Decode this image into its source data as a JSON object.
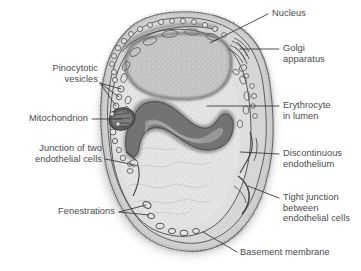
{
  "figure": {
    "style": "grayscale line drawing with stipple shading and drop shadow",
    "colors": {
      "background": "#ffffff",
      "text": "#4a4a4a",
      "leader_line": "#3d3d3d",
      "cytoplasm": "#d9d9d9",
      "lumen": "#e2e2e2",
      "nucleus": "#cfcfcf",
      "erythrocyte_dark": "#6e6e6e",
      "membrane_outline": "#5a5a5a",
      "shadow": "#b8b8b8"
    }
  },
  "structures": [
    {
      "key": "nucleus",
      "name": "Nucleus",
      "description": "large stippled oval region in upper cell body"
    },
    {
      "key": "golgi",
      "name": "Golgi apparatus",
      "description": "stacked parallel membranes at upper right margin"
    },
    {
      "key": "erythrocyte",
      "name": "Erythrocyte in lumen",
      "description": "dark S-curved biconcave cell within the lumen"
    },
    {
      "key": "mitochondrion",
      "name": "Mitochondrion",
      "description": "small dark oval with cristae on left margin"
    },
    {
      "key": "pinocytotic_vesicles",
      "name": "Pinocytotic vesicles",
      "description": "row of small circular vesicles along left membrane"
    },
    {
      "key": "junction_two_cells",
      "name": "Junction of two endothelial cells",
      "description": "break in wall at mid-left"
    },
    {
      "key": "discontinuous",
      "name": "Discontinuous endothelium",
      "description": "gap in endothelial wall at mid-right"
    },
    {
      "key": "tight_junction",
      "name": "Tight junction between endothelial cells",
      "description": "interlocked wall overlap at lower right"
    },
    {
      "key": "fenestrations",
      "name": "Fenestrations",
      "description": "thin pores through the wall at lower left"
    },
    {
      "key": "basement_membrane",
      "name": "Basement membrane",
      "description": "outer investing layer around entire capillary"
    },
    {
      "key": "lumen",
      "name": "Lumen",
      "description": "finely stippled central space of the capillary"
    }
  ],
  "labels": [
    {
      "id": "nucleus",
      "lines": [
        "Nucleus"
      ],
      "align": "left",
      "x": 272,
      "y": 8,
      "leader": [
        [
          268,
          14
        ],
        [
          210,
          43
        ]
      ]
    },
    {
      "id": "golgi-apparatus",
      "lines": [
        "Golgi",
        "apparatus"
      ],
      "align": "left",
      "x": 283,
      "y": 43,
      "leader": [
        [
          279,
          49
        ],
        [
          240,
          49
        ]
      ]
    },
    {
      "id": "erythrocyte-in-lumen",
      "lines": [
        "Erythrocyte",
        "in lumen"
      ],
      "align": "left",
      "x": 283,
      "y": 100,
      "leader": [
        [
          279,
          106
        ],
        [
          207,
          106
        ]
      ]
    },
    {
      "id": "discontinuous-endothelium",
      "lines": [
        "Discontinuous",
        "endothelium"
      ],
      "align": "left",
      "x": 283,
      "y": 148,
      "leader": [
        [
          279,
          154
        ],
        [
          240,
          152
        ]
      ]
    },
    {
      "id": "tight-junction",
      "lines": [
        "Tight junction",
        "between",
        "endothelial cells"
      ],
      "align": "left",
      "x": 283,
      "y": 192,
      "leader": [
        [
          279,
          198
        ],
        [
          248,
          186
        ]
      ]
    },
    {
      "id": "basement-membrane",
      "lines": [
        "Basement membrane"
      ],
      "align": "left",
      "x": 240,
      "y": 247,
      "leader": [
        [
          237,
          252
        ],
        [
          203,
          232
        ]
      ]
    },
    {
      "id": "pinocytotic-vesicles",
      "lines": [
        "Pinocytotic",
        "vesicles"
      ],
      "align": "right",
      "x": 18,
      "y": 63,
      "width": 80,
      "leader_fan": [
        [
          [
            100,
            83
          ],
          [
            121,
            89
          ]
        ],
        [
          [
            100,
            83
          ],
          [
            119,
            97
          ]
        ],
        [
          [
            100,
            83
          ],
          [
            116,
            106
          ]
        ]
      ]
    },
    {
      "id": "mitochondrion",
      "lines": [
        "Mitochondrion"
      ],
      "align": "right",
      "x": 8,
      "y": 113,
      "width": 80,
      "leader": [
        [
          92,
          119
        ],
        [
          122,
          119
        ]
      ]
    },
    {
      "id": "junction-of-two-endothelial-cells",
      "lines": [
        "Junction of two",
        "endothelial cells"
      ],
      "align": "right",
      "x": 12,
      "y": 143,
      "width": 90,
      "leader": [
        [
          105,
          159
        ],
        [
          135,
          165
        ]
      ]
    },
    {
      "id": "fenestrations",
      "lines": [
        "Fenestrations"
      ],
      "align": "right",
      "x": 45,
      "y": 206,
      "width": 70,
      "leader_fan": [
        [
          [
            119,
            212
          ],
          [
            146,
            205
          ]
        ],
        [
          [
            119,
            212
          ],
          [
            149,
            215
          ]
        ]
      ]
    }
  ]
}
